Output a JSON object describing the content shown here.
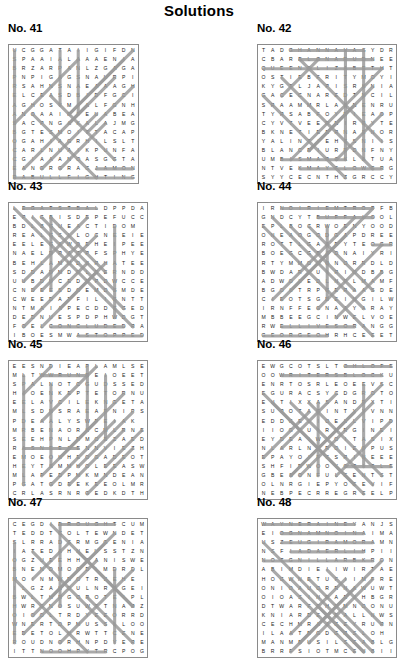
{
  "title": "Solutions",
  "puzzles": [
    {
      "label": "No. 41",
      "cols": 13,
      "rows": 13,
      "cell": 9.1,
      "rows_text": [
        "UCGGATAIIGIFDNA",
        "SPAAIALAAAENIAT",
        "BRZARPANLZGAGAC",
        "PNPIGAGSNAURPIA",
        "RSAHNSNAEAAAGHB",
        "ELCEASDBIDFGCID",
        "AGHOSYMIALFGNHL",
        "ANOAAIRFEUABEAL",
        "SACPNGAKALAJMGN",
        "BGTESMOITTACAPL",
        "OGAHIAGRHILSLTR",
        "CARLNUAIKPUNFAS",
        "CGIAAANOASGGTAS",
        "EANGRGRAGJAMONM",
        "RABULLFIGHTINGT"
      ],
      "grid": [
        "UCGGATAIIGIFDN",
        "SPAAIALAAAENIA",
        "BRZARPANLZGAGA",
        "PNPIGAGSNAURPI",
        "RSAHNSNAEAAAGH",
        "ELCEASDBIDFGCI",
        "AGHOSYMIALFGNH",
        "ANOAAIRFEUABEA",
        "SACPNGAKALAJMG",
        "BGTESMOITTACAP",
        "OGAHIAGRHILSLT",
        "CARLNUAIKPUNFA",
        "CGIAAANOASGGTA",
        "EANGRGRAGJAMON",
        "RABULLFIGHTING"
      ],
      "lines": [
        {
          "x1": 0.5,
          "y1": 14.5,
          "x2": 13.5,
          "y2": 14.5
        },
        {
          "x1": 9.5,
          "y1": 13.5,
          "x2": 13.5,
          "y2": 13.5
        },
        {
          "x1": 0.5,
          "y1": 0.5,
          "x2": 0.5,
          "y2": 14.5
        },
        {
          "x1": 5.5,
          "y1": 0.5,
          "x2": 5.5,
          "y2": 6.5
        },
        {
          "x1": 7.5,
          "y1": 0.5,
          "x2": 7.5,
          "y2": 7.5
        },
        {
          "x1": 13.5,
          "y1": 0.5,
          "x2": 6.5,
          "y2": 7.5
        },
        {
          "x1": 12.5,
          "y1": 1.5,
          "x2": 6.5,
          "y2": 7.5
        },
        {
          "x1": 11.5,
          "y1": 3.5,
          "x2": 6.5,
          "y2": 8.5
        },
        {
          "x1": 13.5,
          "y1": 4.5,
          "x2": 8.5,
          "y2": 9.5
        },
        {
          "x1": 1.5,
          "y1": 13.5,
          "x2": 8.5,
          "y2": 6.5
        },
        {
          "x1": 3.5,
          "y1": 13.5,
          "x2": 9.5,
          "y2": 7.5
        },
        {
          "x1": 5.5,
          "y1": 13.5,
          "x2": 10.5,
          "y2": 8.5
        },
        {
          "x1": 0.5,
          "y1": 8.5,
          "x2": 7.5,
          "y2": 1.5
        },
        {
          "x1": 4.5,
          "y1": 5.5,
          "x2": 11.5,
          "y2": 12.5
        },
        {
          "x1": 2.5,
          "y1": 7.5,
          "x2": 9.5,
          "y2": 14.5
        }
      ]
    },
    {
      "label": "No. 42",
      "cols": 14,
      "rows": 14,
      "cell": 9.1,
      "grid": [
        "TADGHANNAVASYDR",
        "CBARELONARUDNEE",
        "QUEENELIZABETHT",
        "OSTIEBFRITYMOYI",
        "KYGTLJAPISRKNIA",
        "GACECNAREDTNCIL",
        "SRAAMMRLAANENRU",
        "TYRSABFOYRIEAOP",
        "CYVTVEERNIRRYTE",
        "BKNETIEERNAENOR",
        "YALINTIEHSSNIIS",
        "BLANCEIURRDNFNY",
        "UMBISMARCKLATUA",
        "NTVEKMAYFLOWERG",
        "SYYCECNTHZGRCCY"
      ],
      "lines": [
        {
          "x1": 3.5,
          "y1": 0.5,
          "x2": 11.5,
          "y2": 0.5
        },
        {
          "x1": 4.5,
          "y1": 1.5,
          "x2": 12.5,
          "y2": 1.5
        },
        {
          "x1": 0.5,
          "y1": 2.5,
          "x2": 13.5,
          "y2": 2.5
        },
        {
          "x1": 2.5,
          "y1": 12.5,
          "x2": 9.5,
          "y2": 12.5
        },
        {
          "x1": 4.5,
          "y1": 13.5,
          "x2": 13.5,
          "y2": 13.5
        },
        {
          "x1": 9.5,
          "y1": 0.5,
          "x2": 9.5,
          "y2": 12.5
        },
        {
          "x1": 11.5,
          "y1": 0.5,
          "x2": 11.5,
          "y2": 12.5
        },
        {
          "x1": 4.5,
          "y1": 1.5,
          "x2": 13.5,
          "y2": 10.5
        },
        {
          "x1": 2.5,
          "y1": 3.5,
          "x2": 12.5,
          "y2": 13.5
        },
        {
          "x1": 0.5,
          "y1": 5.5,
          "x2": 9.5,
          "y2": 14.5
        },
        {
          "x1": 13.5,
          "y1": 2.5,
          "x2": 3.5,
          "y2": 12.5
        },
        {
          "x1": 12.5,
          "y1": 4.5,
          "x2": 5.5,
          "y2": 11.5
        },
        {
          "x1": 10.5,
          "y1": 6.5,
          "x2": 5.5,
          "y2": 11.5
        },
        {
          "x1": 13.5,
          "y1": 7.5,
          "x2": 8.5,
          "y2": 12.5
        },
        {
          "x1": 6.5,
          "y1": 1.5,
          "x2": 2.5,
          "y2": 5.5
        }
      ]
    },
    {
      "label": "No. 43",
      "cols": 14,
      "rows": 14,
      "cell": 9.1,
      "grid": [
        "LEGATSTBALDPPDA",
        "EPIGBISDEPEFUCC",
        "BDLBGUEACTIDOM",
        "REALGSLLOCNEEIE",
        "EELEGAWDEHEIPEE",
        "NAELDRACPFSPHYE",
        "BEHLAMMDSRHATEE",
        "SDDADMDRLEERNDD",
        "UUBDUCEDRPDWCCE",
        "CNDEESDOEMDSMDE",
        "CWEEDATFILIGNTT",
        "NTMAIAPECDDEGED",
        "DEDNUESPDPHWDGT",
        "FOELCONCLUDEDRA",
        "IBOESMWASTOPPED"
      ],
      "lines": [
        {
          "x1": 1.5,
          "y1": 0.5,
          "x2": 9.5,
          "y2": 0.5
        },
        {
          "x1": 4.5,
          "y1": 13.5,
          "x2": 12.5,
          "y2": 13.5
        },
        {
          "x1": 7.5,
          "y1": 14.5,
          "x2": 14.5,
          "y2": 14.5
        },
        {
          "x1": 0.5,
          "y1": 0.5,
          "x2": 13.5,
          "y2": 13.5
        },
        {
          "x1": 2.5,
          "y1": 1.5,
          "x2": 12.5,
          "y2": 11.5
        },
        {
          "x1": 3.5,
          "y1": 1.5,
          "x2": 11.5,
          "y2": 9.5
        },
        {
          "x1": 4.5,
          "y1": 1.5,
          "x2": 10.5,
          "y2": 7.5
        },
        {
          "x1": 8.5,
          "y1": 1.5,
          "x2": 1.5,
          "y2": 8.5
        },
        {
          "x1": 9.5,
          "y1": 3.5,
          "x2": 3.5,
          "y2": 9.5
        },
        {
          "x1": 7.5,
          "y1": 4.5,
          "x2": 2.5,
          "y2": 9.5
        },
        {
          "x1": 1.5,
          "y1": 13.5,
          "x2": 8.5,
          "y2": 6.5
        },
        {
          "x1": 3.5,
          "y1": 13.5,
          "x2": 9.5,
          "y2": 7.5
        },
        {
          "x1": 5.5,
          "y1": 11.5,
          "x2": 10.5,
          "y2": 6.5
        },
        {
          "x1": 4.5,
          "y1": 1.5,
          "x2": 4.5,
          "y2": 9.5
        },
        {
          "x1": 11.5,
          "y1": 2.5,
          "x2": 11.5,
          "y2": 12.5
        }
      ]
    },
    {
      "label": "No. 44",
      "cols": 14,
      "rows": 14,
      "cell": 9.1,
      "grid": [
        "IRNOIRIEMTROPFB",
        "GNDCYTBUFFALOOL",
        "EPLBOCRWOENYOOD",
        "ONEAOGODGAPDREE",
        "ROTTLGAARYTEOGR",
        "BOEGCGBADNAIYRI",
        "RTYMMOGONORRDLD",
        "BWDARLUIRIODBBG",
        "ADWOLEDLNPLMAMF",
        "BGOLTRPGERAASDE",
        "CIEOTSGDEINGILW",
        "IRNFFEGNAAYARAY",
        "MBBEEGCINWELVOE",
        "RWELLIVESORANGG",
        "GEORGEOHRHCEEET"
      ],
      "lines": [
        {
          "x1": 2.5,
          "y1": 0.5,
          "x2": 12.5,
          "y2": 0.5
        },
        {
          "x1": 6.5,
          "y1": 1.5,
          "x2": 12.5,
          "y2": 1.5
        },
        {
          "x1": 12.5,
          "y1": 4.5,
          "x2": 14.5,
          "y2": 4.5
        },
        {
          "x1": 2.5,
          "y1": 13.5,
          "x2": 10.5,
          "y2": 13.5
        },
        {
          "x1": 0.5,
          "y1": 14.5,
          "x2": 7.5,
          "y2": 14.5
        },
        {
          "x1": 0.5,
          "y1": 2.5,
          "x2": 12.5,
          "y2": 14.5
        },
        {
          "x1": 1.5,
          "y1": 1.5,
          "x2": 11.5,
          "y2": 11.5
        },
        {
          "x1": 3.5,
          "y1": 2.5,
          "x2": 10.5,
          "y2": 9.5
        },
        {
          "x1": 5.5,
          "y1": 2.5,
          "x2": 12.5,
          "y2": 9.5
        },
        {
          "x1": 12.5,
          "y1": 0.5,
          "x2": 2.5,
          "y2": 10.5
        },
        {
          "x1": 10.5,
          "y1": 1.5,
          "x2": 1.5,
          "y2": 10.5
        },
        {
          "x1": 13.5,
          "y1": 4.5,
          "x2": 6.5,
          "y2": 11.5
        },
        {
          "x1": 9.5,
          "y1": 3.5,
          "x2": 3.5,
          "y2": 9.5
        },
        {
          "x1": 13.5,
          "y1": 7.5,
          "x2": 8.5,
          "y2": 12.5
        },
        {
          "x1": 7.5,
          "y1": 2.5,
          "x2": 7.5,
          "y2": 10.5
        }
      ]
    },
    {
      "label": "No. 45",
      "cols": 14,
      "rows": 14,
      "cell": 9.1,
      "grid": [
        "EESNDIEAPLAMLSE",
        "MLTWWRUNREIOEET",
        "SPALNOTCGUDSSED",
        "HIOENKEPTETORNU",
        "EELAVCILEKNGETA",
        "MLSDNSRAEAPNIPS",
        "PDEAALYSWPEIAK",
        "MRBENAORKCMLRNE",
        "SEEHPNLRMOEZAED",
        "RASNEEZENNVIEZH",
        "EMOEOKHEOGADEOT",
        "HEYTSMMHOLEEASW",
        "MLAPEDPMKMNDEAN",
        "PGATGDEEKEEOLMR",
        "CRLASRNRGEDKDTH"
      ],
      "lines": [
        {
          "x1": 3.5,
          "y1": 1.5,
          "x2": 8.5,
          "y2": 1.5
        },
        {
          "x1": 1.5,
          "y1": 9.5,
          "x2": 7.5,
          "y2": 9.5
        },
        {
          "x1": 1.5,
          "y1": 1.5,
          "x2": 1.5,
          "y2": 13.5
        },
        {
          "x1": 4.5,
          "y1": 2.5,
          "x2": 4.5,
          "y2": 11.5
        },
        {
          "x1": 8.5,
          "y1": 0.5,
          "x2": 8.5,
          "y2": 7.5
        },
        {
          "x1": 10.5,
          "y1": 1.5,
          "x2": 10.5,
          "y2": 8.5
        },
        {
          "x1": 9.5,
          "y1": 0.5,
          "x2": 3.5,
          "y2": 6.5
        },
        {
          "x1": 12.5,
          "y1": 3.5,
          "x2": 5.5,
          "y2": 10.5
        },
        {
          "x1": 13.5,
          "y1": 5.5,
          "x2": 7.5,
          "y2": 11.5
        },
        {
          "x1": 14.5,
          "y1": 7.5,
          "x2": 10.5,
          "y2": 11.5
        },
        {
          "x1": 1.5,
          "y1": 3.5,
          "x2": 4.5,
          "y2": 0.5
        },
        {
          "x1": 4.5,
          "y1": 13.5,
          "x2": 11.5,
          "y2": 6.5
        },
        {
          "x1": 6.5,
          "y1": 13.5,
          "x2": 12.5,
          "y2": 7.5
        },
        {
          "x1": 8.5,
          "y1": 14.5,
          "x2": 13.5,
          "y2": 9.5
        },
        {
          "x1": 3.5,
          "y1": 12.5,
          "x2": 9.5,
          "y2": 6.5
        }
      ]
    },
    {
      "label": "No. 46",
      "cols": 14,
      "rows": 14,
      "cell": 9.1,
      "grid": [
        "EWGCOTSLTOHLOFE",
        "OOWRITERSBLOCKU",
        "ENRTOSRLEOEEVSC",
        "EGURACSYCDGROTO",
        "EUTIXXASANDRXTI",
        "SUROTAGINTYYVNN",
        "EDDGELIOELLVIPD",
        "IIOGCUIRNRGINEI",
        "EYDEAIWLOITASIX",
        "NLARLNRROIEOPUS",
        "EPAYOIFFSRINEEE",
        "SHFIRWOOYOTITLE",
        "GBESONFULEENTST",
        "OLNRGIEPYOEEVIF",
        "NEBPECRREGREELP"
      ],
      "lines": [
        {
          "x1": 9.5,
          "y1": 0.5,
          "x2": 14.5,
          "y2": 0.5
        },
        {
          "x1": 2.5,
          "y1": 1.5,
          "x2": 13.5,
          "y2": 1.5
        },
        {
          "x1": 9.5,
          "y1": 11.5,
          "x2": 14.5,
          "y2": 11.5
        },
        {
          "x1": 0.5,
          "y1": 3.5,
          "x2": 11.5,
          "y2": 14.5
        },
        {
          "x1": 1.5,
          "y1": 4.5,
          "x2": 10.5,
          "y2": 13.5
        },
        {
          "x1": 3.5,
          "y1": 4.5,
          "x2": 12.5,
          "y2": 13.5
        },
        {
          "x1": 5.5,
          "y1": 4.5,
          "x2": 13.5,
          "y2": 12.5
        },
        {
          "x1": 13.5,
          "y1": 2.5,
          "x2": 3.5,
          "y2": 12.5
        },
        {
          "x1": 12.5,
          "y1": 4.5,
          "x2": 4.5,
          "y2": 12.5
        },
        {
          "x1": 10.5,
          "y1": 5.5,
          "x2": 3.5,
          "y2": 12.5
        },
        {
          "x1": 14.5,
          "y1": 6.5,
          "x2": 8.5,
          "y2": 12.5
        },
        {
          "x1": 8.5,
          "y1": 3.5,
          "x2": 2.5,
          "y2": 9.5
        },
        {
          "x1": 0.5,
          "y1": 10.5,
          "x2": 5.5,
          "y2": 5.5
        },
        {
          "x1": 6.5,
          "y1": 4.5,
          "x2": 6.5,
          "y2": 12.5
        },
        {
          "x1": 11.5,
          "y1": 2.5,
          "x2": 11.5,
          "y2": 11.5
        }
      ]
    },
    {
      "label": "No. 47",
      "cols": 14,
      "rows": 14,
      "cell": 9.1,
      "grid": [
        "CEGDIDROUGHTCUM",
        "TEDDTCOLTEWNDET",
        "SLRRADSRMGGENIA",
        "IATEDAHNEUSSTZN",
        "OGZUEEHHEANISWE",
        "BNENDMOODLMDRDL",
        "MOINMWROTRSEHE",
        "ILGZAHDULNRRGEI",
        "BWLTHRGOROTEIPL",
        "HWRGNOSUWTTNARZ",
        "OIOOLTRDYEEORRD",
        "WNERTDPMUSSLLOO",
        "EDETOLHRWTTCENE",
        "ROUDNORHNPDYERE",
        "ITTNOOHPYTRCPOG"
      ],
      "lines": [
        {
          "x1": 5.5,
          "y1": 0.5,
          "x2": 11.5,
          "y2": 0.5
        },
        {
          "x1": 3.5,
          "y1": 14.5,
          "x2": 10.5,
          "y2": 14.5
        },
        {
          "x1": 0.5,
          "y1": 2.5,
          "x2": 0.5,
          "y2": 13.5
        },
        {
          "x1": 5.5,
          "y1": 0.5,
          "x2": 5.5,
          "y2": 9.5
        },
        {
          "x1": 11.5,
          "y1": 5.5,
          "x2": 11.5,
          "y2": 13.5
        },
        {
          "x1": 4.5,
          "y1": 0.5,
          "x2": 13.5,
          "y2": 9.5
        },
        {
          "x1": 2.5,
          "y1": 3.5,
          "x2": 10.5,
          "y2": 11.5
        },
        {
          "x1": 0.5,
          "y1": 6.5,
          "x2": 8.5,
          "y2": 14.5
        },
        {
          "x1": 11.5,
          "y1": 1.5,
          "x2": 2.5,
          "y2": 10.5
        },
        {
          "x1": 9.5,
          "y1": 4.5,
          "x2": 1.5,
          "y2": 12.5
        },
        {
          "x1": 13.5,
          "y1": 5.5,
          "x2": 5.5,
          "y2": 13.5
        },
        {
          "x1": 2.5,
          "y1": 6.5,
          "x2": 6.5,
          "y2": 2.5
        },
        {
          "x1": 7.5,
          "y1": 3.5,
          "x2": 13.5,
          "y2": 9.5
        },
        {
          "x1": 4.5,
          "y1": 8.5,
          "x2": 10.5,
          "y2": 2.5
        },
        {
          "x1": 8.5,
          "y1": 8.5,
          "x2": 13.5,
          "y2": 13.5
        }
      ]
    },
    {
      "label": "No. 48",
      "cols": 14,
      "rows": 14,
      "cell": 9.1,
      "grid": [
        "WAYNERAINEYANJS",
        "EIOGNAMNOINAIMA",
        "USZEUGIRAMORAMN",
        "NSFIADAERLIHPII",
        "NOTGNILLARBKRON",
        "ABIMDIEIIWIRTAE",
        "HOGWNETUFIIMFRE",
        "ONIOAUORRNAWUWT",
        "OIOASINRAEJHBGR",
        "DTWARFEHRMNOONU",
        "KNIARDEIEALLNWS",
        "CECHMRAJGEYRURN",
        "ILAATBGDGRSLOH",
        "MANMBUSILSEABLG",
        "BRRFSIOTMCENBII"
      ],
      "lines": [
        {
          "x1": 0.5,
          "y1": 0.5,
          "x2": 10.5,
          "y2": 0.5
        },
        {
          "x1": 2.5,
          "y1": 1.5,
          "x2": 11.5,
          "y2": 1.5
        },
        {
          "x1": 2.5,
          "y1": 2.5,
          "x2": 12.5,
          "y2": 2.5
        },
        {
          "x1": 3.5,
          "y1": 3.5,
          "x2": 11.5,
          "y2": 3.5
        },
        {
          "x1": 0.5,
          "y1": 4.5,
          "x2": 12.5,
          "y2": 4.5
        },
        {
          "x1": 0.5,
          "y1": 2.5,
          "x2": 12.5,
          "y2": 14.5
        },
        {
          "x1": 1.5,
          "y1": 5.5,
          "x2": 10.5,
          "y2": 14.5
        },
        {
          "x1": 3.5,
          "y1": 6.5,
          "x2": 11.5,
          "y2": 14.5
        },
        {
          "x1": 5.5,
          "y1": 6.5,
          "x2": 12.5,
          "y2": 13.5
        },
        {
          "x1": 13.5,
          "y1": 4.5,
          "x2": 3.5,
          "y2": 14.5
        },
        {
          "x1": 12.5,
          "y1": 6.5,
          "x2": 5.5,
          "y2": 13.5
        },
        {
          "x1": 10.5,
          "y1": 7.5,
          "x2": 4.5,
          "y2": 13.5
        },
        {
          "x1": 9.5,
          "y1": 6.5,
          "x2": 3.5,
          "y2": 12.5
        },
        {
          "x1": 7.5,
          "y1": 5.5,
          "x2": 13.5,
          "y2": 11.5
        },
        {
          "x1": 6.5,
          "y1": 9.5,
          "x2": 11.5,
          "y2": 14.5
        }
      ]
    }
  ],
  "style": {
    "line_color": "#9a9a9a",
    "border_color": "#8a8a8a",
    "text_color": "#1a1a1a",
    "background": "#ffffff"
  }
}
